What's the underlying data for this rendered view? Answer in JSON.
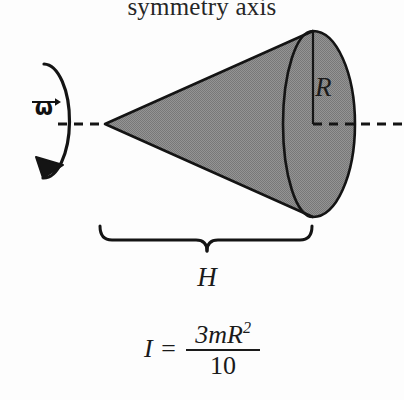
{
  "diagram": {
    "title": "symmetry axis",
    "labels": {
      "radius": "R",
      "height": "H",
      "angular_velocity": "ω"
    },
    "formula": {
      "quantity": "I",
      "equals": "=",
      "numerator": "3mR",
      "numerator_exponent": "2",
      "denominator": "10",
      "plain_text": "I = 3mR² / 10"
    },
    "colors": {
      "cone_fill": "#8c8c8c",
      "outline": "#141414",
      "background": "#fdfdfd",
      "text": "#1a1a1a"
    },
    "geometry": {
      "apex_x": 105,
      "apex_y": 124,
      "axis_y": 124,
      "base_center_x": 313,
      "base_rx": 42,
      "base_ry": 93,
      "rim_arc_rx": 30,
      "brace_left_x": 100,
      "brace_right_x": 312,
      "brace_y": 232,
      "rotation_ellipse_cx": 44,
      "rotation_ellipse_cy": 121,
      "rotation_ellipse_rx": 26,
      "rotation_ellipse_ry": 57
    }
  }
}
